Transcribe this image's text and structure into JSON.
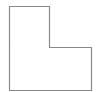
{
  "diagram": {
    "type": "polygon-outline",
    "shape_name": "L-shape",
    "canvas": {
      "width": 100,
      "height": 92,
      "background": "#ffffff"
    },
    "stroke_color": "#8a8a8a",
    "stroke_width": 1.2,
    "fill": "none",
    "points": [
      [
        9.5,
        6.5
      ],
      [
        49.5,
        6.5
      ],
      [
        49.5,
        47.5
      ],
      [
        91.5,
        47.5
      ],
      [
        91.5,
        90.5
      ],
      [
        9.5,
        90.5
      ]
    ]
  }
}
